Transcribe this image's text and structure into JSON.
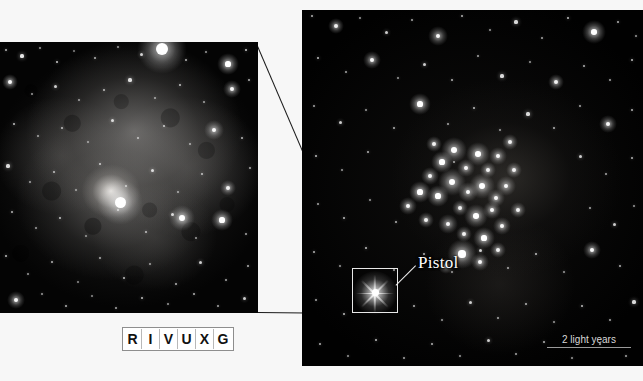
{
  "figure": {
    "kind": "astronomical-photograph",
    "background_color": "#f7f7f7",
    "panels": {
      "inset": {
        "name": "pistol-nebula-closeup",
        "x": 0,
        "y": 42,
        "width": 258,
        "height": 271,
        "description": "Close-up of the Pistol Nebula, a grey cloud surrounding the bright Pistol Star"
      },
      "main": {
        "name": "quintuplet-cluster-wide-field",
        "x": 302,
        "y": 10,
        "width": 341,
        "height": 356,
        "description": "Wide-field star cluster view with dense star cluster and callout box"
      }
    }
  },
  "annotations": {
    "pistol_label": "Pistol",
    "scale_label": "2 light years",
    "callout_box": {
      "x": 352,
      "y": 268,
      "width": 46,
      "height": 45
    }
  },
  "wavelength_band": {
    "name": "R I V U X G wavelength indicator",
    "letters": [
      "R",
      "I",
      "V",
      "U",
      "X",
      "G"
    ],
    "active_letter": "I",
    "x": 122,
    "y": 327,
    "border_color": "#8e8e8e",
    "text_color": "#111111"
  },
  "colors": {
    "page_background": "#f7f7f7",
    "space_black": "#010101",
    "star_white": "#ffffff",
    "nebula_grey": "#8e8c8a",
    "annotation_white": "#f0f0f0",
    "connector_line": "#1a1a1a"
  },
  "starfields": {
    "inset_stars": [
      {
        "x": 6,
        "y": 8,
        "r": 1.2,
        "b": 0.7
      },
      {
        "x": 22,
        "y": 14,
        "r": 1.6,
        "b": 0.9
      },
      {
        "x": 40,
        "y": 6,
        "r": 1.1,
        "b": 0.6
      },
      {
        "x": 57,
        "y": 20,
        "r": 1.4,
        "b": 0.8
      },
      {
        "x": 74,
        "y": 9,
        "r": 1.0,
        "b": 0.5
      },
      {
        "x": 95,
        "y": 16,
        "r": 1.3,
        "b": 0.7
      },
      {
        "x": 118,
        "y": 5,
        "r": 1.1,
        "b": 0.6
      },
      {
        "x": 141,
        "y": 12,
        "r": 1.5,
        "b": 0.8
      },
      {
        "x": 162,
        "y": 7,
        "r": 6.0,
        "b": 1.0
      },
      {
        "x": 186,
        "y": 18,
        "r": 1.3,
        "b": 0.7
      },
      {
        "x": 206,
        "y": 10,
        "r": 1.2,
        "b": 0.6
      },
      {
        "x": 228,
        "y": 22,
        "r": 2.6,
        "b": 1.0
      },
      {
        "x": 246,
        "y": 8,
        "r": 1.4,
        "b": 0.8
      },
      {
        "x": 10,
        "y": 40,
        "r": 2.0,
        "b": 0.95
      },
      {
        "x": 32,
        "y": 52,
        "r": 1.2,
        "b": 0.6
      },
      {
        "x": 55,
        "y": 44,
        "r": 1.5,
        "b": 0.8
      },
      {
        "x": 79,
        "y": 58,
        "r": 1.1,
        "b": 0.6
      },
      {
        "x": 104,
        "y": 48,
        "r": 1.3,
        "b": 0.7
      },
      {
        "x": 130,
        "y": 38,
        "r": 1.6,
        "b": 0.85
      },
      {
        "x": 155,
        "y": 56,
        "r": 1.2,
        "b": 0.6
      },
      {
        "x": 180,
        "y": 43,
        "r": 1.4,
        "b": 0.75
      },
      {
        "x": 204,
        "y": 60,
        "r": 1.1,
        "b": 0.6
      },
      {
        "x": 232,
        "y": 47,
        "r": 2.2,
        "b": 0.95
      },
      {
        "x": 249,
        "y": 38,
        "r": 1.3,
        "b": 0.7
      },
      {
        "x": 14,
        "y": 82,
        "r": 1.4,
        "b": 0.75
      },
      {
        "x": 38,
        "y": 94,
        "r": 1.1,
        "b": 0.6
      },
      {
        "x": 62,
        "y": 86,
        "r": 1.3,
        "b": 0.7
      },
      {
        "x": 88,
        "y": 100,
        "r": 1.0,
        "b": 0.55
      },
      {
        "x": 112,
        "y": 78,
        "r": 1.5,
        "b": 0.8
      },
      {
        "x": 138,
        "y": 96,
        "r": 1.2,
        "b": 0.65
      },
      {
        "x": 164,
        "y": 84,
        "r": 1.4,
        "b": 0.75
      },
      {
        "x": 190,
        "y": 102,
        "r": 1.1,
        "b": 0.6
      },
      {
        "x": 214,
        "y": 88,
        "r": 2.4,
        "b": 0.95
      },
      {
        "x": 242,
        "y": 96,
        "r": 1.3,
        "b": 0.7
      },
      {
        "x": 8,
        "y": 124,
        "r": 1.6,
        "b": 0.85
      },
      {
        "x": 30,
        "y": 140,
        "r": 1.1,
        "b": 0.6
      },
      {
        "x": 54,
        "y": 130,
        "r": 1.3,
        "b": 0.7
      },
      {
        "x": 76,
        "y": 148,
        "r": 1.0,
        "b": 0.55
      },
      {
        "x": 100,
        "y": 122,
        "r": 1.4,
        "b": 0.75
      },
      {
        "x": 126,
        "y": 144,
        "r": 1.2,
        "b": 0.65
      },
      {
        "x": 152,
        "y": 128,
        "r": 1.5,
        "b": 0.8
      },
      {
        "x": 178,
        "y": 150,
        "r": 1.1,
        "b": 0.6
      },
      {
        "x": 202,
        "y": 132,
        "r": 1.3,
        "b": 0.7
      },
      {
        "x": 228,
        "y": 146,
        "r": 2.0,
        "b": 0.9
      },
      {
        "x": 250,
        "y": 126,
        "r": 1.2,
        "b": 0.65
      },
      {
        "x": 12,
        "y": 170,
        "r": 1.3,
        "b": 0.7
      },
      {
        "x": 36,
        "y": 186,
        "r": 1.1,
        "b": 0.6
      },
      {
        "x": 60,
        "y": 176,
        "r": 1.4,
        "b": 0.75
      },
      {
        "x": 86,
        "y": 194,
        "r": 1.0,
        "b": 0.55
      },
      {
        "x": 118,
        "y": 168,
        "r": 1.2,
        "b": 0.65
      },
      {
        "x": 146,
        "y": 190,
        "r": 1.3,
        "b": 0.7
      },
      {
        "x": 172,
        "y": 172,
        "r": 1.5,
        "b": 0.8
      },
      {
        "x": 196,
        "y": 196,
        "r": 1.1,
        "b": 0.6
      },
      {
        "x": 222,
        "y": 178,
        "r": 2.6,
        "b": 1.0
      },
      {
        "x": 246,
        "y": 192,
        "r": 1.2,
        "b": 0.65
      },
      {
        "x": 6,
        "y": 214,
        "r": 1.4,
        "b": 0.75
      },
      {
        "x": 28,
        "y": 232,
        "r": 1.1,
        "b": 0.6
      },
      {
        "x": 52,
        "y": 220,
        "r": 1.3,
        "b": 0.7
      },
      {
        "x": 78,
        "y": 240,
        "r": 1.0,
        "b": 0.55
      },
      {
        "x": 100,
        "y": 216,
        "r": 1.2,
        "b": 0.65
      },
      {
        "x": 124,
        "y": 236,
        "r": 1.4,
        "b": 0.75
      },
      {
        "x": 150,
        "y": 222,
        "r": 1.1,
        "b": 0.6
      },
      {
        "x": 176,
        "y": 242,
        "r": 1.3,
        "b": 0.7
      },
      {
        "x": 200,
        "y": 220,
        "r": 1.5,
        "b": 0.8
      },
      {
        "x": 226,
        "y": 238,
        "r": 1.2,
        "b": 0.65
      },
      {
        "x": 248,
        "y": 224,
        "r": 1.3,
        "b": 0.7
      },
      {
        "x": 16,
        "y": 258,
        "r": 2.2,
        "b": 0.95
      },
      {
        "x": 42,
        "y": 252,
        "r": 1.1,
        "b": 0.6
      },
      {
        "x": 66,
        "y": 264,
        "r": 1.3,
        "b": 0.7
      },
      {
        "x": 92,
        "y": 254,
        "r": 1.0,
        "b": 0.55
      },
      {
        "x": 116,
        "y": 266,
        "r": 1.2,
        "b": 0.65
      },
      {
        "x": 142,
        "y": 256,
        "r": 1.4,
        "b": 0.75
      },
      {
        "x": 168,
        "y": 262,
        "r": 1.1,
        "b": 0.6
      },
      {
        "x": 194,
        "y": 252,
        "r": 1.3,
        "b": 0.7
      },
      {
        "x": 218,
        "y": 264,
        "r": 1.2,
        "b": 0.65
      },
      {
        "x": 244,
        "y": 256,
        "r": 1.5,
        "b": 0.8
      },
      {
        "x": 120,
        "y": 160,
        "r": 5.5,
        "b": 1.0
      },
      {
        "x": 182,
        "y": 176,
        "r": 3.0,
        "b": 1.0
      }
    ],
    "main_stars": [
      {
        "x": 10,
        "y": 6,
        "r": 1.3,
        "b": 0.7
      },
      {
        "x": 34,
        "y": 16,
        "r": 2.0,
        "b": 0.9
      },
      {
        "x": 58,
        "y": 8,
        "r": 1.1,
        "b": 0.6
      },
      {
        "x": 84,
        "y": 22,
        "r": 1.5,
        "b": 0.8
      },
      {
        "x": 110,
        "y": 10,
        "r": 1.2,
        "b": 0.65
      },
      {
        "x": 136,
        "y": 26,
        "r": 2.4,
        "b": 0.95
      },
      {
        "x": 160,
        "y": 6,
        "r": 1.3,
        "b": 0.7
      },
      {
        "x": 188,
        "y": 20,
        "r": 1.1,
        "b": 0.6
      },
      {
        "x": 214,
        "y": 12,
        "r": 1.6,
        "b": 0.85
      },
      {
        "x": 240,
        "y": 28,
        "r": 1.2,
        "b": 0.65
      },
      {
        "x": 266,
        "y": 8,
        "r": 1.4,
        "b": 0.75
      },
      {
        "x": 292,
        "y": 22,
        "r": 2.8,
        "b": 1.0
      },
      {
        "x": 316,
        "y": 12,
        "r": 1.3,
        "b": 0.7
      },
      {
        "x": 334,
        "y": 26,
        "r": 1.1,
        "b": 0.6
      },
      {
        "x": 16,
        "y": 48,
        "r": 1.4,
        "b": 0.75
      },
      {
        "x": 44,
        "y": 62,
        "r": 1.2,
        "b": 0.65
      },
      {
        "x": 70,
        "y": 50,
        "r": 2.2,
        "b": 0.95
      },
      {
        "x": 96,
        "y": 68,
        "r": 1.1,
        "b": 0.6
      },
      {
        "x": 122,
        "y": 54,
        "r": 1.5,
        "b": 0.8
      },
      {
        "x": 150,
        "y": 70,
        "r": 1.3,
        "b": 0.7
      },
      {
        "x": 176,
        "y": 46,
        "r": 1.2,
        "b": 0.65
      },
      {
        "x": 200,
        "y": 66,
        "r": 1.6,
        "b": 0.85
      },
      {
        "x": 228,
        "y": 52,
        "r": 1.1,
        "b": 0.6
      },
      {
        "x": 254,
        "y": 72,
        "r": 2.0,
        "b": 0.9
      },
      {
        "x": 282,
        "y": 56,
        "r": 1.3,
        "b": 0.7
      },
      {
        "x": 308,
        "y": 70,
        "r": 1.2,
        "b": 0.65
      },
      {
        "x": 330,
        "y": 50,
        "r": 1.4,
        "b": 0.75
      },
      {
        "x": 12,
        "y": 96,
        "r": 1.2,
        "b": 0.65
      },
      {
        "x": 38,
        "y": 112,
        "r": 1.5,
        "b": 0.8
      },
      {
        "x": 64,
        "y": 100,
        "r": 1.1,
        "b": 0.6
      },
      {
        "x": 92,
        "y": 118,
        "r": 1.3,
        "b": 0.7
      },
      {
        "x": 118,
        "y": 94,
        "r": 2.6,
        "b": 1.0
      },
      {
        "x": 146,
        "y": 114,
        "r": 1.2,
        "b": 0.65
      },
      {
        "x": 172,
        "y": 98,
        "r": 1.4,
        "b": 0.75
      },
      {
        "x": 198,
        "y": 120,
        "r": 1.1,
        "b": 0.6
      },
      {
        "x": 226,
        "y": 104,
        "r": 1.6,
        "b": 0.85
      },
      {
        "x": 252,
        "y": 118,
        "r": 1.3,
        "b": 0.7
      },
      {
        "x": 278,
        "y": 96,
        "r": 1.2,
        "b": 0.65
      },
      {
        "x": 306,
        "y": 114,
        "r": 2.2,
        "b": 0.95
      },
      {
        "x": 330,
        "y": 100,
        "r": 1.3,
        "b": 0.7
      },
      {
        "x": 14,
        "y": 146,
        "r": 1.4,
        "b": 0.75
      },
      {
        "x": 40,
        "y": 160,
        "r": 1.1,
        "b": 0.6
      },
      {
        "x": 66,
        "y": 142,
        "r": 1.3,
        "b": 0.7
      },
      {
        "x": 152,
        "y": 152,
        "r": 1.2,
        "b": 0.65
      },
      {
        "x": 278,
        "y": 146,
        "r": 1.5,
        "b": 0.8
      },
      {
        "x": 304,
        "y": 164,
        "r": 1.2,
        "b": 0.65
      },
      {
        "x": 330,
        "y": 148,
        "r": 1.3,
        "b": 0.7
      },
      {
        "x": 16,
        "y": 194,
        "r": 1.2,
        "b": 0.65
      },
      {
        "x": 42,
        "y": 208,
        "r": 1.4,
        "b": 0.75
      },
      {
        "x": 68,
        "y": 190,
        "r": 1.1,
        "b": 0.6
      },
      {
        "x": 94,
        "y": 212,
        "r": 1.3,
        "b": 0.7
      },
      {
        "x": 288,
        "y": 198,
        "r": 1.2,
        "b": 0.65
      },
      {
        "x": 312,
        "y": 214,
        "r": 1.5,
        "b": 0.8
      },
      {
        "x": 332,
        "y": 196,
        "r": 1.1,
        "b": 0.6
      },
      {
        "x": 12,
        "y": 242,
        "r": 1.3,
        "b": 0.7
      },
      {
        "x": 38,
        "y": 256,
        "r": 1.1,
        "b": 0.6
      },
      {
        "x": 64,
        "y": 238,
        "r": 1.4,
        "b": 0.75
      },
      {
        "x": 92,
        "y": 260,
        "r": 1.2,
        "b": 0.65
      },
      {
        "x": 122,
        "y": 244,
        "r": 1.3,
        "b": 0.7
      },
      {
        "x": 150,
        "y": 262,
        "r": 1.1,
        "b": 0.6
      },
      {
        "x": 178,
        "y": 240,
        "r": 1.5,
        "b": 0.8
      },
      {
        "x": 206,
        "y": 258,
        "r": 1.2,
        "b": 0.65
      },
      {
        "x": 234,
        "y": 244,
        "r": 1.4,
        "b": 0.75
      },
      {
        "x": 262,
        "y": 262,
        "r": 1.1,
        "b": 0.6
      },
      {
        "x": 290,
        "y": 240,
        "r": 2.2,
        "b": 0.95
      },
      {
        "x": 318,
        "y": 256,
        "r": 1.3,
        "b": 0.7
      },
      {
        "x": 14,
        "y": 290,
        "r": 1.2,
        "b": 0.65
      },
      {
        "x": 42,
        "y": 304,
        "r": 1.4,
        "b": 0.75
      },
      {
        "x": 112,
        "y": 296,
        "r": 1.3,
        "b": 0.7
      },
      {
        "x": 140,
        "y": 310,
        "r": 1.1,
        "b": 0.6
      },
      {
        "x": 168,
        "y": 292,
        "r": 1.5,
        "b": 0.8
      },
      {
        "x": 196,
        "y": 308,
        "r": 1.2,
        "b": 0.65
      },
      {
        "x": 224,
        "y": 294,
        "r": 1.3,
        "b": 0.7
      },
      {
        "x": 252,
        "y": 312,
        "r": 1.1,
        "b": 0.6
      },
      {
        "x": 280,
        "y": 296,
        "r": 1.4,
        "b": 0.75
      },
      {
        "x": 308,
        "y": 310,
        "r": 1.2,
        "b": 0.65
      },
      {
        "x": 332,
        "y": 292,
        "r": 1.6,
        "b": 0.85
      },
      {
        "x": 18,
        "y": 334,
        "r": 1.3,
        "b": 0.7
      },
      {
        "x": 46,
        "y": 346,
        "r": 1.1,
        "b": 0.6
      },
      {
        "x": 74,
        "y": 330,
        "r": 1.4,
        "b": 0.75
      },
      {
        "x": 102,
        "y": 348,
        "r": 1.2,
        "b": 0.65
      },
      {
        "x": 130,
        "y": 334,
        "r": 1.3,
        "b": 0.7
      },
      {
        "x": 158,
        "y": 346,
        "r": 1.1,
        "b": 0.6
      },
      {
        "x": 186,
        "y": 330,
        "r": 1.5,
        "b": 0.8
      },
      {
        "x": 214,
        "y": 344,
        "r": 1.2,
        "b": 0.65
      },
      {
        "x": 242,
        "y": 332,
        "r": 1.3,
        "b": 0.7
      },
      {
        "x": 270,
        "y": 348,
        "r": 1.1,
        "b": 0.6
      },
      {
        "x": 298,
        "y": 334,
        "r": 1.4,
        "b": 0.75
      },
      {
        "x": 324,
        "y": 346,
        "r": 1.2,
        "b": 0.65
      }
    ],
    "cluster_stars": [
      {
        "x": 140,
        "y": 152,
        "r": 2.6,
        "b": 1.0
      },
      {
        "x": 152,
        "y": 140,
        "r": 3.2,
        "b": 1.0
      },
      {
        "x": 164,
        "y": 158,
        "r": 2.2,
        "b": 0.95
      },
      {
        "x": 176,
        "y": 144,
        "r": 2.8,
        "b": 1.0
      },
      {
        "x": 186,
        "y": 160,
        "r": 2.0,
        "b": 0.9
      },
      {
        "x": 150,
        "y": 172,
        "r": 3.4,
        "b": 1.0
      },
      {
        "x": 166,
        "y": 182,
        "r": 2.4,
        "b": 0.95
      },
      {
        "x": 180,
        "y": 176,
        "r": 3.0,
        "b": 1.0
      },
      {
        "x": 194,
        "y": 188,
        "r": 2.2,
        "b": 0.95
      },
      {
        "x": 136,
        "y": 186,
        "r": 2.6,
        "b": 1.0
      },
      {
        "x": 158,
        "y": 198,
        "r": 2.0,
        "b": 0.9
      },
      {
        "x": 174,
        "y": 206,
        "r": 2.8,
        "b": 1.0
      },
      {
        "x": 190,
        "y": 200,
        "r": 2.2,
        "b": 0.95
      },
      {
        "x": 204,
        "y": 176,
        "r": 2.4,
        "b": 0.95
      },
      {
        "x": 212,
        "y": 160,
        "r": 2.0,
        "b": 0.9
      },
      {
        "x": 128,
        "y": 166,
        "r": 2.2,
        "b": 0.95
      },
      {
        "x": 118,
        "y": 182,
        "r": 2.6,
        "b": 1.0
      },
      {
        "x": 146,
        "y": 214,
        "r": 2.4,
        "b": 0.95
      },
      {
        "x": 162,
        "y": 224,
        "r": 2.0,
        "b": 0.9
      },
      {
        "x": 182,
        "y": 228,
        "r": 2.6,
        "b": 1.0
      },
      {
        "x": 200,
        "y": 216,
        "r": 2.2,
        "b": 0.95
      },
      {
        "x": 216,
        "y": 200,
        "r": 2.0,
        "b": 0.9
      },
      {
        "x": 106,
        "y": 196,
        "r": 2.2,
        "b": 0.95
      },
      {
        "x": 124,
        "y": 210,
        "r": 2.0,
        "b": 0.9
      },
      {
        "x": 196,
        "y": 146,
        "r": 2.2,
        "b": 0.95
      },
      {
        "x": 208,
        "y": 132,
        "r": 2.0,
        "b": 0.9
      },
      {
        "x": 132,
        "y": 134,
        "r": 2.0,
        "b": 0.9
      },
      {
        "x": 160,
        "y": 244,
        "r": 3.6,
        "b": 1.0
      },
      {
        "x": 178,
        "y": 252,
        "r": 2.2,
        "b": 0.95
      },
      {
        "x": 144,
        "y": 256,
        "r": 2.0,
        "b": 0.9
      },
      {
        "x": 196,
        "y": 240,
        "r": 2.0,
        "b": 0.9
      }
    ]
  }
}
